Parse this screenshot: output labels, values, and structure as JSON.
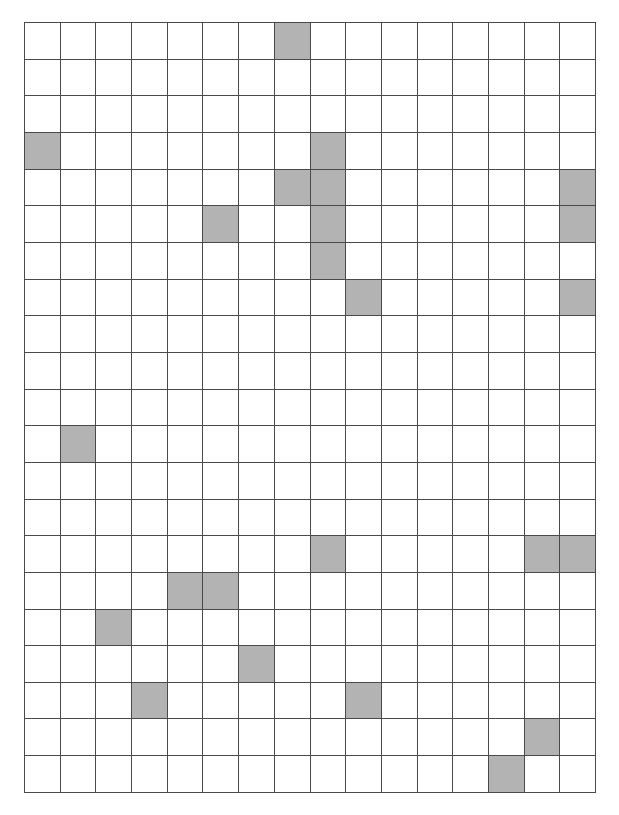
{
  "canvas": {
    "width": 619,
    "height": 815,
    "background": "#ffffff"
  },
  "grid": {
    "name": "shaded-cell-grid",
    "columns": 16,
    "rows": 21,
    "origin_x": 24,
    "origin_y": 22,
    "width": 572,
    "height": 771,
    "cell_width": 35.75,
    "cell_height": 36.7,
    "line_color": "#4a4a4a",
    "line_width": 1.4,
    "cell_empty_color": "#ffffff",
    "cell_filled_color": "#b3b3b3",
    "filled_count": 22
  },
  "chart_data": {
    "type": "heatmap",
    "title": "",
    "xlabel": "",
    "ylabel": "",
    "columns": 16,
    "rows": 21,
    "legend": [
      {
        "label": "empty",
        "color": "#ffffff",
        "value": 0
      },
      {
        "label": "shaded",
        "color": "#b3b3b3",
        "value": 1
      }
    ],
    "filled_cells": [
      {
        "row": 0,
        "col": 7
      },
      {
        "row": 3,
        "col": 0
      },
      {
        "row": 3,
        "col": 8
      },
      {
        "row": 4,
        "col": 7
      },
      {
        "row": 4,
        "col": 8
      },
      {
        "row": 4,
        "col": 15
      },
      {
        "row": 5,
        "col": 5
      },
      {
        "row": 5,
        "col": 8
      },
      {
        "row": 5,
        "col": 15
      },
      {
        "row": 6,
        "col": 8
      },
      {
        "row": 7,
        "col": 9
      },
      {
        "row": 7,
        "col": 15
      },
      {
        "row": 11,
        "col": 1
      },
      {
        "row": 14,
        "col": 8
      },
      {
        "row": 14,
        "col": 14
      },
      {
        "row": 14,
        "col": 15
      },
      {
        "row": 15,
        "col": 4
      },
      {
        "row": 15,
        "col": 5
      },
      {
        "row": 16,
        "col": 2
      },
      {
        "row": 17,
        "col": 6
      },
      {
        "row": 18,
        "col": 3
      },
      {
        "row": 18,
        "col": 9
      },
      {
        "row": 19,
        "col": 14
      },
      {
        "row": 20,
        "col": 13
      }
    ],
    "matrix": [
      [
        0,
        0,
        0,
        0,
        0,
        0,
        0,
        1,
        0,
        0,
        0,
        0,
        0,
        0,
        0,
        0
      ],
      [
        0,
        0,
        0,
        0,
        0,
        0,
        0,
        0,
        0,
        0,
        0,
        0,
        0,
        0,
        0,
        0
      ],
      [
        0,
        0,
        0,
        0,
        0,
        0,
        0,
        0,
        0,
        0,
        0,
        0,
        0,
        0,
        0,
        0
      ],
      [
        1,
        0,
        0,
        0,
        0,
        0,
        0,
        0,
        1,
        0,
        0,
        0,
        0,
        0,
        0,
        0
      ],
      [
        0,
        0,
        0,
        0,
        0,
        0,
        0,
        1,
        1,
        0,
        0,
        0,
        0,
        0,
        0,
        1
      ],
      [
        0,
        0,
        0,
        0,
        0,
        1,
        0,
        0,
        1,
        0,
        0,
        0,
        0,
        0,
        0,
        1
      ],
      [
        0,
        0,
        0,
        0,
        0,
        0,
        0,
        0,
        1,
        0,
        0,
        0,
        0,
        0,
        0,
        0
      ],
      [
        0,
        0,
        0,
        0,
        0,
        0,
        0,
        0,
        0,
        1,
        0,
        0,
        0,
        0,
        0,
        1
      ],
      [
        0,
        0,
        0,
        0,
        0,
        0,
        0,
        0,
        0,
        0,
        0,
        0,
        0,
        0,
        0,
        0
      ],
      [
        0,
        0,
        0,
        0,
        0,
        0,
        0,
        0,
        0,
        0,
        0,
        0,
        0,
        0,
        0,
        0
      ],
      [
        0,
        0,
        0,
        0,
        0,
        0,
        0,
        0,
        0,
        0,
        0,
        0,
        0,
        0,
        0,
        0
      ],
      [
        0,
        1,
        0,
        0,
        0,
        0,
        0,
        0,
        0,
        0,
        0,
        0,
        0,
        0,
        0,
        0
      ],
      [
        0,
        0,
        0,
        0,
        0,
        0,
        0,
        0,
        0,
        0,
        0,
        0,
        0,
        0,
        0,
        0
      ],
      [
        0,
        0,
        0,
        0,
        0,
        0,
        0,
        0,
        0,
        0,
        0,
        0,
        0,
        0,
        0,
        0
      ],
      [
        0,
        0,
        0,
        0,
        0,
        0,
        0,
        0,
        1,
        0,
        0,
        0,
        0,
        0,
        1,
        1
      ],
      [
        0,
        0,
        0,
        0,
        1,
        1,
        0,
        0,
        0,
        0,
        0,
        0,
        0,
        0,
        0,
        0
      ],
      [
        0,
        0,
        1,
        0,
        0,
        0,
        0,
        0,
        0,
        0,
        0,
        0,
        0,
        0,
        0,
        0
      ],
      [
        0,
        0,
        0,
        0,
        0,
        0,
        1,
        0,
        0,
        0,
        0,
        0,
        0,
        0,
        0,
        0
      ],
      [
        0,
        0,
        0,
        1,
        0,
        0,
        0,
        0,
        0,
        1,
        0,
        0,
        0,
        0,
        0,
        0
      ],
      [
        0,
        0,
        0,
        0,
        0,
        0,
        0,
        0,
        0,
        0,
        0,
        0,
        0,
        0,
        1,
        0
      ],
      [
        0,
        0,
        0,
        0,
        0,
        0,
        0,
        0,
        0,
        0,
        0,
        0,
        0,
        1,
        0,
        0
      ]
    ]
  }
}
